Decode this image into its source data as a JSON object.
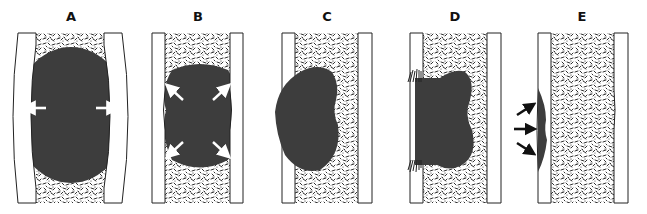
{
  "figure": {
    "type": "schematic-diagram",
    "panel_count": 5,
    "colors": {
      "mass": "#3d3d3d",
      "wall_fill": "#ffffff",
      "wall_stroke": "#222222",
      "texture": "#1a1a1a",
      "arrow_white": "#ffffff",
      "arrow_black": "#111111"
    },
    "panels": [
      {
        "label": "A",
        "description": "Large oval mass bowing both walls outward",
        "arrows": "white, pointing left and right (outward)"
      },
      {
        "label": "B",
        "description": "Bilobed mass with walls slightly bowed",
        "arrows": "white, pointing diagonally outward (4)"
      },
      {
        "label": "C",
        "description": "Kidney-shaped mass eroding the left wall",
        "arrows": "none"
      },
      {
        "label": "D",
        "description": "Mass breaching left wall with spiculated periosteal reaction",
        "arrows": "none"
      },
      {
        "label": "E",
        "description": "Thin surface lesion on outer left wall",
        "arrows": "black, pointing inward toward the wall (3)"
      }
    ]
  }
}
